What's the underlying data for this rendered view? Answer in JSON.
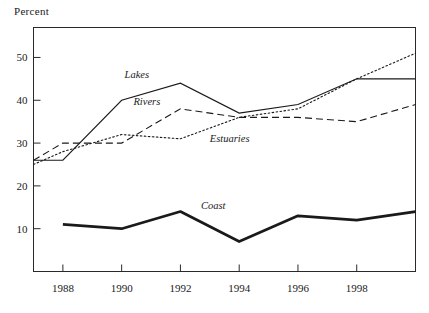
{
  "chart_data": {
    "type": "line",
    "title": "",
    "xlabel": "",
    "ylabel": "Percent",
    "x": [
      1987,
      1988,
      1990,
      1992,
      1994,
      1996,
      1998,
      2000
    ],
    "xlim": [
      1987,
      2000
    ],
    "ylim": [
      0,
      57
    ],
    "xticks": [
      1988,
      1990,
      1992,
      1994,
      1996,
      1998
    ],
    "xtick_labels": [
      "1988",
      "1990",
      "1992",
      "1994",
      "1996",
      "1998"
    ],
    "yticks": [
      10,
      20,
      30,
      40,
      50
    ],
    "ytick_labels": [
      "10",
      "20",
      "30",
      "40",
      "50"
    ],
    "grid": false,
    "legend_position": "inline-labels",
    "series": [
      {
        "name": "Lakes",
        "style": "solid",
        "color": "#1a1a1a",
        "x": [
          1987,
          1988,
          1990,
          1992,
          1994,
          1996,
          1998,
          2000
        ],
        "values": [
          26,
          26,
          40,
          44,
          37,
          39,
          45,
          45
        ]
      },
      {
        "name": "Rivers",
        "style": "dashed",
        "color": "#1a1a1a",
        "x": [
          1987,
          1988,
          1990,
          1992,
          1994,
          1996,
          1998,
          2000
        ],
        "values": [
          26,
          30,
          30,
          38,
          36,
          36,
          35,
          39
        ]
      },
      {
        "name": "Estuaries",
        "style": "dotted",
        "color": "#1a1a1a",
        "x": [
          1987,
          1988,
          1990,
          1992,
          1994,
          1996,
          1998,
          2000
        ],
        "values": [
          25,
          28,
          32,
          31,
          36,
          38,
          45,
          51
        ]
      },
      {
        "name": "Coast",
        "style": "thick-solid",
        "color": "#1a1a1a",
        "x": [
          1988,
          1990,
          1992,
          1994,
          1996,
          1998,
          2000
        ],
        "values": [
          11,
          10,
          14,
          7,
          13,
          12,
          14
        ]
      }
    ],
    "annotations": [
      {
        "text": "Lakes",
        "x": 1990.1,
        "y": 45.2
      },
      {
        "text": "Rivers",
        "x": 1990.4,
        "y": 39.0
      },
      {
        "text": "Estuaries",
        "x": 1993.0,
        "y": 30.2
      },
      {
        "text": "Coast",
        "x": 1992.7,
        "y": 14.6
      }
    ]
  }
}
